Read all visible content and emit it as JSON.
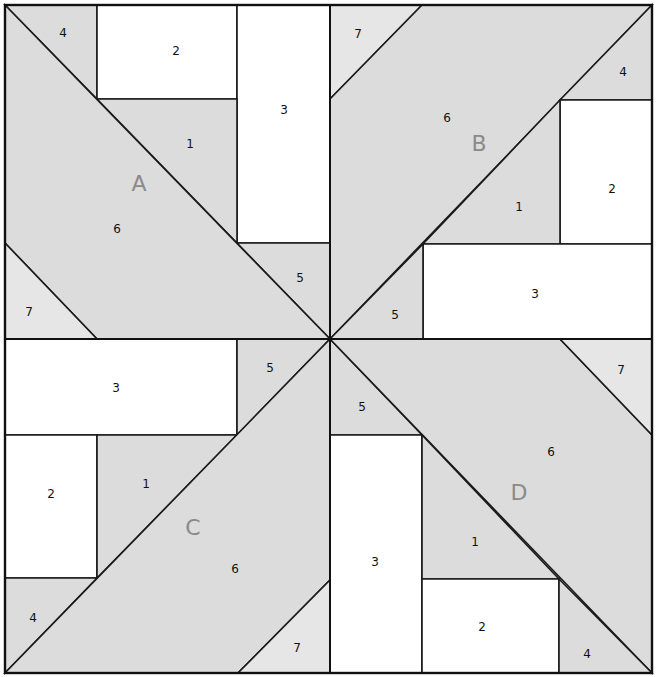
{
  "colors": {
    "shaded": "#dcdcdc",
    "light": "#e6e6e6",
    "white": "#ffffff",
    "line": "#1a1a1a",
    "label": "#8a8a8a"
  },
  "quadrants": [
    {
      "label": "A",
      "label_pos": [
        139,
        185
      ],
      "pieces": [
        {
          "num": "4",
          "fill": "shaded",
          "points": "5,5 97,5 97,99",
          "num_pos": [
            63,
            33
          ]
        },
        {
          "num": "2",
          "fill": "white",
          "points": "97,5 237,5 237,99 97,99",
          "num_pos": [
            176,
            51
          ]
        },
        {
          "num": "3",
          "fill": "white",
          "points": "237,5 330,5 330,243 237,243",
          "num_pos": [
            284,
            110
          ]
        },
        {
          "num": "1",
          "fill": "shaded",
          "points": "97,99 237,99 237,243",
          "num_pos": [
            190,
            144
          ]
        },
        {
          "num": "5",
          "fill": "shaded",
          "points": "237,243 330,243 330,339",
          "num_pos": [
            300,
            278
          ]
        },
        {
          "num": "6",
          "fill": "shaded",
          "points": "5,5 330,339 97,339 5,243",
          "num_pos": [
            117,
            229
          ]
        },
        {
          "num": "7",
          "fill": "light",
          "points": "5,243 97,339 5,339",
          "num_pos": [
            29,
            312
          ]
        }
      ]
    },
    {
      "label": "B",
      "label_pos": [
        479,
        145
      ],
      "pieces": [
        {
          "num": "7",
          "fill": "light",
          "points": "330,5 422,5 330,99",
          "num_pos": [
            358,
            34
          ]
        },
        {
          "num": "6",
          "fill": "shaded",
          "points": "422,5 652,5 330,339 330,99",
          "num_pos": [
            447,
            118
          ]
        },
        {
          "num": "4",
          "fill": "shaded",
          "points": "652,5 652,100 560,100",
          "num_pos": [
            623,
            72
          ]
        },
        {
          "num": "2",
          "fill": "white",
          "points": "560,100 652,100 652,244 560,244",
          "num_pos": [
            612,
            189
          ]
        },
        {
          "num": "1",
          "fill": "shaded",
          "points": "560,100 560,244 423,244",
          "num_pos": [
            519,
            207
          ]
        },
        {
          "num": "3",
          "fill": "white",
          "points": "423,244 652,244 652,339 423,339",
          "num_pos": [
            535,
            294
          ]
        },
        {
          "num": "5",
          "fill": "shaded",
          "points": "423,244 423,339 330,339",
          "num_pos": [
            395,
            315
          ]
        }
      ]
    },
    {
      "label": "C",
      "label_pos": [
        193,
        529
      ],
      "pieces": [
        {
          "num": "3",
          "fill": "white",
          "points": "5,339 237,339 237,435 5,435",
          "num_pos": [
            116,
            388
          ]
        },
        {
          "num": "5",
          "fill": "shaded",
          "points": "237,339 330,339 237,435",
          "num_pos": [
            270,
            368
          ]
        },
        {
          "num": "2",
          "fill": "white",
          "points": "5,435 97,435 97,578 5,578",
          "num_pos": [
            51,
            494
          ]
        },
        {
          "num": "1",
          "fill": "shaded",
          "points": "97,435 237,435 97,578",
          "num_pos": [
            146,
            484
          ]
        },
        {
          "num": "4",
          "fill": "shaded",
          "points": "5,578 97,578 5,673",
          "num_pos": [
            33,
            618
          ]
        },
        {
          "num": "6",
          "fill": "shaded",
          "points": "330,339 330,580 238,673 5,673",
          "num_pos": [
            235,
            569
          ]
        },
        {
          "num": "7",
          "fill": "light",
          "points": "330,580 330,673 238,673",
          "num_pos": [
            297,
            648
          ]
        }
      ]
    },
    {
      "label": "D",
      "label_pos": [
        519,
        494
      ],
      "pieces": [
        {
          "num": "5",
          "fill": "shaded",
          "points": "330,339 422,435 330,435",
          "num_pos": [
            362,
            407
          ]
        },
        {
          "num": "6",
          "fill": "shaded",
          "points": "330,339 560,339 652,435 652,673",
          "num_pos": [
            551,
            452
          ]
        },
        {
          "num": "7",
          "fill": "light",
          "points": "560,339 652,339 652,435",
          "num_pos": [
            621,
            370
          ]
        },
        {
          "num": "3",
          "fill": "white",
          "points": "330,435 422,435 422,673 330,673",
          "num_pos": [
            375,
            562
          ]
        },
        {
          "num": "1",
          "fill": "shaded",
          "points": "422,435 559,579 422,579",
          "num_pos": [
            475,
            542
          ]
        },
        {
          "num": "2",
          "fill": "white",
          "points": "422,579 559,579 559,673 422,673",
          "num_pos": [
            482,
            627
          ]
        },
        {
          "num": "4",
          "fill": "shaded",
          "points": "559,579 652,673 559,673",
          "num_pos": [
            587,
            654
          ]
        }
      ]
    }
  ]
}
